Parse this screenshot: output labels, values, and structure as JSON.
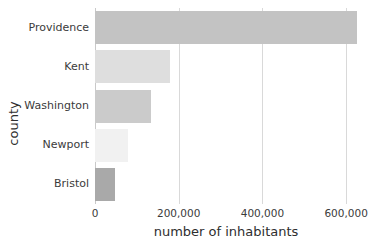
{
  "chart_data": {
    "type": "bar",
    "orientation": "horizontal",
    "title": "",
    "xlabel": "number of inhabitants",
    "ylabel": "county",
    "categories": [
      "Providence",
      "Kent",
      "Washington",
      "Newport",
      "Bristol"
    ],
    "values": [
      626000,
      179000,
      133000,
      80000,
      48000
    ],
    "series": [
      {
        "name": "number of inhabitants",
        "values": [
          626000,
          179000,
          133000,
          80000,
          48000
        ]
      }
    ],
    "bar_colors": [
      "#c3c3c3",
      "#dedede",
      "#cbcbcb",
      "#f1f1f1",
      "#a9a9a9"
    ],
    "xlim": [
      0,
      626000
    ],
    "ylim": [
      0,
      5
    ],
    "xticks": [
      0,
      200000,
      400000,
      600000
    ],
    "xtick_labels": [
      "0",
      "200,000",
      "400,000",
      "600,000"
    ],
    "ytick_labels": [
      "Providence",
      "Kent",
      "Washington",
      "Newport",
      "Bristol"
    ],
    "grid": "vertical",
    "gridline_color": "#d9d9d9",
    "legend": "none",
    "background": "#ffffff"
  },
  "axes": {
    "x_title": "number of inhabitants",
    "y_title": "county"
  },
  "ticks": {
    "x": [
      {
        "label": "0",
        "value": 0
      },
      {
        "label": "200,000",
        "value": 200000
      },
      {
        "label": "400,000",
        "value": 400000
      },
      {
        "label": "600,000",
        "value": 600000
      }
    ],
    "y": [
      {
        "label": "Providence"
      },
      {
        "label": "Kent"
      },
      {
        "label": "Washington"
      },
      {
        "label": "Newport"
      },
      {
        "label": "Bristol"
      }
    ]
  }
}
